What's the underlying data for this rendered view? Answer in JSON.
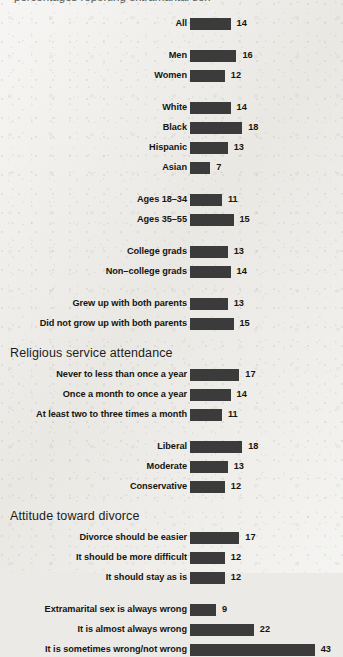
{
  "title_fragment": "percentages reporting extramarital sex",
  "chart_data": {
    "type": "bar",
    "title": "",
    "xlabel": "",
    "ylabel": "",
    "orientation": "horizontal",
    "grid": false,
    "legend": false,
    "xlim": [
      0,
      43
    ],
    "categories": [
      "All",
      "Men",
      "Women",
      "White",
      "Black",
      "Hispanic",
      "Asian",
      "Ages 18–34",
      "Ages 35–55",
      "College grads",
      "Non–college grads",
      "Grew up with both parents",
      "Did not grow up with both parents",
      "Never to less than once a year",
      "Once a month to once a year",
      "At least two to three times a month",
      "Liberal",
      "Moderate",
      "Conservative",
      "Divorce should be easier",
      "It should be more difficult",
      "It should stay as is",
      "Extramarital sex is always wrong",
      "It is almost always wrong",
      "It is sometimes wrong/not wrong"
    ],
    "values": [
      14,
      16,
      12,
      14,
      18,
      13,
      7,
      11,
      15,
      13,
      14,
      13,
      15,
      17,
      14,
      11,
      18,
      13,
      12,
      17,
      12,
      12,
      9,
      22,
      43
    ],
    "bar_color": "#3b3b3b",
    "background_color": "#ecebe7",
    "section_headers": [
      "Religious service attendance",
      "Attitude toward divorce"
    ],
    "groups": [
      {
        "header": null,
        "rows": [
          {
            "label": "All",
            "value": 14
          }
        ]
      },
      {
        "header": null,
        "rows": [
          {
            "label": "Men",
            "value": 16
          },
          {
            "label": "Women",
            "value": 12
          }
        ]
      },
      {
        "header": null,
        "rows": [
          {
            "label": "White",
            "value": 14
          },
          {
            "label": "Black",
            "value": 18
          },
          {
            "label": "Hispanic",
            "value": 13
          },
          {
            "label": "Asian",
            "value": 7
          }
        ]
      },
      {
        "header": null,
        "rows": [
          {
            "label": "Ages 18–34",
            "value": 11
          },
          {
            "label": "Ages 35–55",
            "value": 15
          }
        ]
      },
      {
        "header": null,
        "rows": [
          {
            "label": "College grads",
            "value": 13
          },
          {
            "label": "Non–college grads",
            "value": 14
          }
        ]
      },
      {
        "header": null,
        "rows": [
          {
            "label": "Grew up with both parents",
            "value": 13
          },
          {
            "label": "Did not grow up with both parents",
            "value": 15
          }
        ]
      },
      {
        "header": "Religious service attendance",
        "rows": [
          {
            "label": "Never to less than once a year",
            "value": 17
          },
          {
            "label": "Once a month to once a year",
            "value": 14
          },
          {
            "label": "At least two to three times a month",
            "value": 11
          }
        ]
      },
      {
        "header": null,
        "rows": [
          {
            "label": "Liberal",
            "value": 18
          },
          {
            "label": "Moderate",
            "value": 13
          },
          {
            "label": "Conservative",
            "value": 12
          }
        ]
      },
      {
        "header": "Attitude toward divorce",
        "rows": [
          {
            "label": "Divorce should be easier",
            "value": 17
          },
          {
            "label": "It should be more difficult",
            "value": 12
          },
          {
            "label": "It should stay as is",
            "value": 12
          }
        ]
      },
      {
        "header": null,
        "rows": [
          {
            "label": "Extramarital sex is always wrong",
            "value": 9
          },
          {
            "label": "It is almost always wrong",
            "value": 22
          },
          {
            "label": "It is sometimes wrong/not wrong",
            "value": 43
          }
        ]
      }
    ]
  },
  "layout": {
    "bar_origin_x": 190,
    "px_per_unit": 2.9,
    "row_pitch": 20,
    "group_gap": 12,
    "first_row_top": 17,
    "header_height": 19
  }
}
